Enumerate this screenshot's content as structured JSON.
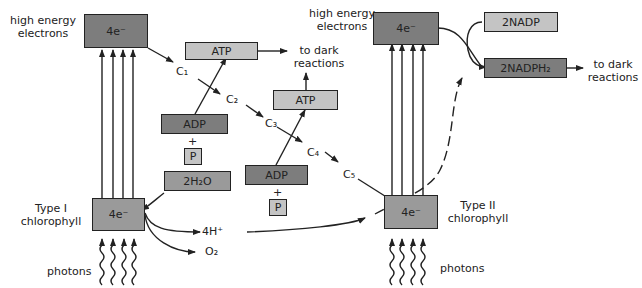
{
  "diagram": {
    "left": {
      "high_energy_label": [
        "high energy",
        "electrons"
      ],
      "electrons_box": "4e⁻",
      "chlorophyll_label": [
        "Type I",
        "chlorophyll"
      ],
      "chlorophyll_box": "4e⁻",
      "photons_label": "photons",
      "water_box": "2H₂O",
      "proton_label": "4H⁺",
      "oxygen_label": "O₂"
    },
    "carriers": [
      "C₁",
      "C₂",
      "C₃",
      "C₄",
      "C₅"
    ],
    "atp_1": {
      "atp": "ATP",
      "adp": "ADP",
      "plus": "+",
      "p": "P",
      "to": [
        "to dark",
        "reactions"
      ]
    },
    "atp_2": {
      "atp": "ATP",
      "adp": "ADP",
      "plus": "+",
      "p": "P",
      "to": [
        "to dark",
        "reactions"
      ]
    },
    "right": {
      "high_energy_label": [
        "high energy",
        "electrons"
      ],
      "electrons_box": "4e⁻",
      "chlorophyll_label": [
        "Type II",
        "chlorophyll"
      ],
      "chlorophyll_box": "4e⁻",
      "photons_label": "photons",
      "nadp_box": "2NADP",
      "nadph_box": "2NADPH₂",
      "to": [
        "to dark",
        "reactions"
      ]
    },
    "colors": {
      "dark_box": "#7d7d7d",
      "mid_box": "#9a9a9a",
      "light_box": "#c4c4c4",
      "line": "#222222"
    }
  }
}
